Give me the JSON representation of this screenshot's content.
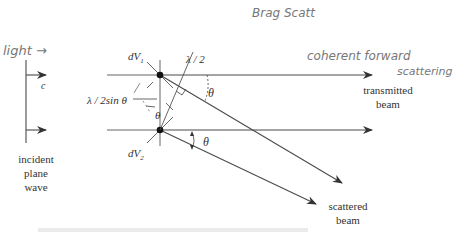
{
  "diagram": {
    "type": "physics-diagram",
    "labels": {
      "dv1": "dV",
      "dv1_sub": "1",
      "dv2": "dV",
      "dv2_sub": "2",
      "half_lambda": "λ / 2",
      "path_diff": "λ / 2sin θ",
      "theta_top": "θ",
      "theta_mid": "θ",
      "theta_bottom": "θ",
      "speed": "c",
      "incident_1": "incident",
      "incident_2": "plane",
      "incident_3": "wave",
      "transmitted_1": "transmitted",
      "transmitted_2": "beam",
      "scattered_1": "scattered",
      "scattered_2": "beam"
    },
    "handwritten": {
      "light": "light →",
      "bragg": "Brag Scatt",
      "coherent": "coherent forward",
      "scattering": "scattering"
    },
    "colors": {
      "ink": "#333333",
      "pencil": "#777777"
    }
  }
}
